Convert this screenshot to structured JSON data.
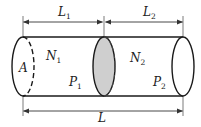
{
  "diagram": {
    "colors": {
      "line": "#1a1a1a",
      "shaded_section": "#cfcfcf",
      "background": "#ffffff"
    },
    "dimensions": {
      "top_left": {
        "symbol": "L",
        "subscript": "1"
      },
      "top_right": {
        "symbol": "L",
        "subscript": "2"
      },
      "bottom": {
        "symbol": "L",
        "subscript": ""
      }
    },
    "labels": {
      "area": {
        "symbol": "A",
        "subscript": ""
      },
      "n1": {
        "symbol": "N",
        "subscript": "1"
      },
      "p1": {
        "symbol": "P",
        "subscript": "1"
      },
      "n2": {
        "symbol": "N",
        "subscript": "2"
      },
      "p2": {
        "symbol": "P",
        "subscript": "2"
      }
    }
  }
}
